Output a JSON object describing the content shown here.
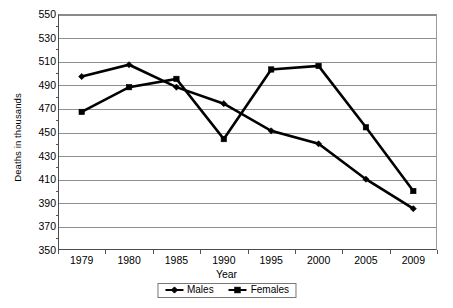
{
  "chart_data": {
    "type": "line",
    "title": "",
    "xlabel": "Year",
    "ylabel": "Deaths in thousands",
    "categories": [
      "1979",
      "1980",
      "1985",
      "1990",
      "1995",
      "2000",
      "2005",
      "2009"
    ],
    "series": [
      {
        "name": "Males",
        "marker": "diamond",
        "color": "#000000",
        "values": [
          497,
          507,
          488,
          474,
          451,
          440,
          410,
          385
        ]
      },
      {
        "name": "Females",
        "marker": "square",
        "color": "#000000",
        "values": [
          467,
          488,
          495,
          444,
          503,
          506,
          454,
          400
        ]
      }
    ],
    "ylim": [
      350,
      550
    ],
    "ytick_step": 20,
    "yticks": [
      350,
      370,
      390,
      410,
      430,
      450,
      470,
      490,
      510,
      530,
      550
    ],
    "ytick_labels": [
      "350",
      "370",
      "390",
      "410",
      "430",
      "450",
      "470",
      "490",
      "510",
      "530",
      "550"
    ],
    "grid": "horizontal",
    "legend_position": "bottom-center",
    "legend_entries": [
      "Males",
      "Females"
    ]
  }
}
